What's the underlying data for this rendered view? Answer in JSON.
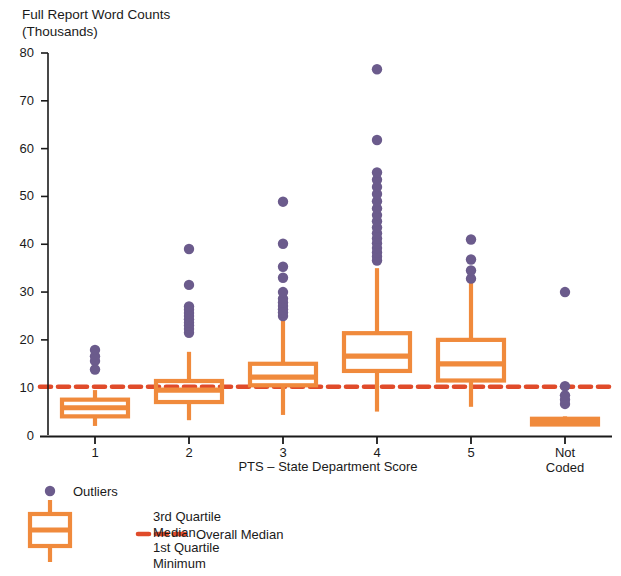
{
  "chart_data": {
    "type": "box",
    "title": "Full Report Word Counts (Thousands)",
    "xlabel": "PTS – State Department Score",
    "ylabel": "Full Report Word Counts (Thousands)",
    "categories": [
      "1",
      "2",
      "3",
      "4",
      "5",
      "Not Coded"
    ],
    "ylim": [
      0,
      80
    ],
    "ytick_labels": [
      "0",
      "10",
      "20",
      "30",
      "40",
      "50",
      "60",
      "70",
      "80"
    ],
    "ytick_values": [
      0,
      10,
      20,
      30,
      40,
      50,
      60,
      70,
      80
    ],
    "grid": false,
    "legend_position": "below-axes",
    "overall_median": 10.2,
    "boxes": [
      {
        "category": "1",
        "min": 2.0,
        "q1": 4.0,
        "median": 5.8,
        "q3": 7.5,
        "max": 9.5,
        "outliers": [
          13.8,
          15.6,
          16.6,
          17.9
        ]
      },
      {
        "category": "2",
        "min": 3.2,
        "q1": 7.0,
        "median": 9.5,
        "q3": 11.4,
        "max": 17.5,
        "outliers": [
          21.5,
          22.3,
          23.0,
          23.6,
          24.3,
          25.0,
          25.6,
          26.3,
          27.0,
          31.5,
          39.0
        ]
      },
      {
        "category": "3",
        "min": 4.3,
        "q1": 10.5,
        "median": 12.2,
        "q3": 15.0,
        "max": 24.0,
        "outliers": [
          25.0,
          25.7,
          26.4,
          27.1,
          27.8,
          28.6,
          30.0,
          33.0,
          35.3,
          40.1,
          48.9
        ]
      },
      {
        "category": "4",
        "min": 5.0,
        "q1": 13.5,
        "median": 16.6,
        "q3": 21.4,
        "max": 35.0,
        "outliers": [
          36.6,
          37.4,
          38.3,
          39.2,
          40.2,
          41.2,
          42.3,
          43.5,
          44.8,
          46.1,
          47.5,
          49.0,
          50.5,
          52.0,
          53.5,
          55.0,
          61.8,
          76.6
        ]
      },
      {
        "category": "5",
        "min": 6.0,
        "q1": 11.5,
        "median": 15.0,
        "q3": 20.0,
        "max": 32.0,
        "outliers": [
          32.8,
          34.5,
          36.8,
          41.0
        ]
      },
      {
        "category": "Not Coded",
        "min": 2.0,
        "q1": 2.3,
        "median": 2.9,
        "q3": 3.5,
        "max": 4.0,
        "outliers": [
          6.6,
          7.5,
          8.4,
          10.3,
          30.0
        ]
      }
    ]
  },
  "legend": {
    "outliers_label": "Outliers",
    "box_labels": "3rd Quartile\nMedian\n1st Quartile\nMinimum",
    "overall_median_label": "Overall Median"
  },
  "colors": {
    "box": "#F08A3C",
    "outlier": "#6B5B8C",
    "overall_median": "#E04B2A",
    "axis": "#1a1a1a",
    "background": "#ffffff"
  }
}
